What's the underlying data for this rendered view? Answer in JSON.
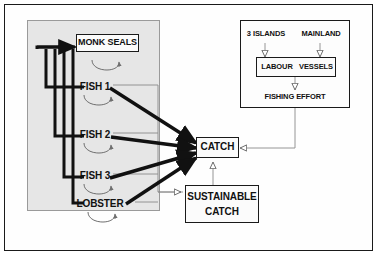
{
  "diagram": {
    "colors": {
      "frame_border": "#1a1a1a",
      "panel_fill": "#e6e6e6",
      "panel_border": "#9a9a9a",
      "box_fill": "#fbfbfb",
      "box_border": "#1a1a1a",
      "thick_link": "#111111",
      "thin_link": "#8a8a8a",
      "loop_arc": "#6f6f6f",
      "text": "#111111",
      "page_background": "#ffffff"
    },
    "stock_panel": {
      "name": "marine-stock-panel",
      "nodes": [
        {
          "id": "monk-seals",
          "label": "MONK SEALS",
          "boxed": true,
          "self_loop": true
        },
        {
          "id": "fish-1",
          "label": "FISH 1",
          "boxed": false,
          "self_loop": true
        },
        {
          "id": "fish-2",
          "label": "FISH 2",
          "boxed": false,
          "self_loop": true
        },
        {
          "id": "fish-3",
          "label": "FISH 3",
          "boxed": false,
          "self_loop": true
        },
        {
          "id": "lobster",
          "label": "LOBSTER",
          "boxed": false,
          "self_loop": true
        }
      ]
    },
    "effort_panel": {
      "name": "fishing-effort-panel",
      "sources": [
        {
          "id": "three-islands",
          "label": "3 ISLANDS"
        },
        {
          "id": "mainland",
          "label": "MAINLAND"
        }
      ],
      "resources_box": {
        "id": "labour-vessels",
        "items": [
          {
            "id": "labour",
            "label": "LABOUR"
          },
          {
            "id": "vessels",
            "label": "VESSELS"
          }
        ]
      },
      "output": {
        "id": "fishing-effort",
        "label": "FISHING EFFORT"
      }
    },
    "catch": {
      "id": "catch",
      "label": "CATCH"
    },
    "sustainable_catch": {
      "id": "sustainable-catch",
      "label_line_1": "SUSTAINABLE",
      "label_line_2": "CATCH"
    },
    "flows": {
      "harvest_arrows": [
        {
          "from": "fish-1",
          "to": "catch",
          "weight": "thick"
        },
        {
          "from": "fish-2",
          "to": "catch",
          "weight": "thick"
        },
        {
          "from": "fish-3",
          "to": "catch",
          "weight": "thick"
        },
        {
          "from": "lobster",
          "to": "catch",
          "weight": "thick"
        }
      ],
      "feedback_arrows": [
        {
          "from": "catch",
          "to": "monk-seals",
          "weight": "thick"
        },
        {
          "from": "catch",
          "to": "fish-1",
          "weight": "thick"
        },
        {
          "from": "catch",
          "to": "fish-2",
          "weight": "thick"
        },
        {
          "from": "catch",
          "to": "fish-3",
          "weight": "thick"
        },
        {
          "from": "catch",
          "to": "lobster",
          "weight": "thick"
        }
      ],
      "influence_arrows": [
        {
          "from": "fishing-effort",
          "to": "catch",
          "weight": "thin"
        },
        {
          "from": "sustainable-catch",
          "to": "catch",
          "weight": "thin"
        },
        {
          "from": "stock-panel",
          "to": "sustainable-catch",
          "weight": "thin"
        },
        {
          "from": "three-islands",
          "to": "labour",
          "weight": "thin"
        },
        {
          "from": "mainland",
          "to": "vessels",
          "weight": "thin"
        },
        {
          "from": "labour-vessels",
          "to": "fishing-effort",
          "weight": "thin"
        }
      ]
    }
  }
}
